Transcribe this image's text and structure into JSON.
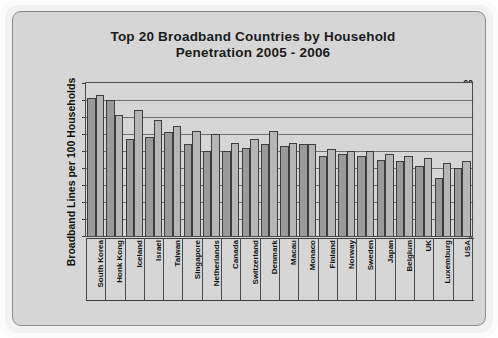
{
  "chart_data": {
    "type": "bar",
    "title": "Top 20 Broadband Countries by Household Penetration 2005 - 2006",
    "title_line1": "Top 20 Broadband Countries by Household",
    "title_line2": "Penetration 2005 - 2006",
    "xlabel": "",
    "ylabel": "Broadband Lines per 100 Households",
    "ylim": [
      0,
      90
    ],
    "ytick_labels": [
      "90",
      "80",
      "70",
      "60",
      "50",
      "40",
      "30",
      "20",
      "10",
      "0"
    ],
    "ytick_values": [
      90,
      80,
      70,
      60,
      50,
      40,
      30,
      20,
      10,
      0
    ],
    "grid": true,
    "legend_position": "top-right",
    "source_note": "Source: Point Topic",
    "categories": [
      "South Korea",
      "Honk Kong",
      "Iceland",
      "Israel",
      "Taiwan",
      "Singapore",
      "Netherlands",
      "Canada",
      "Switzerland",
      "Denmark",
      "Macau",
      "Monaco",
      "Finland",
      "Norway",
      "Sweden",
      "Japan",
      "Belgium",
      "UK",
      "Luxemburg",
      "USA"
    ],
    "series": [
      {
        "name": "Q1, 2005",
        "color": "#9a9a9a",
        "values": [
          81,
          80,
          57,
          58,
          61,
          54,
          50,
          50,
          52,
          54,
          53,
          54,
          47,
          48,
          47,
          45,
          44,
          41,
          34,
          40
        ]
      },
      {
        "name": "Q1, 2006",
        "color": "#b6b6b6",
        "values": [
          83,
          71,
          74,
          68,
          65,
          62,
          60,
          55,
          57,
          62,
          55,
          54,
          51,
          50,
          50,
          48,
          47,
          46,
          43,
          44
        ]
      }
    ]
  },
  "colors": {
    "series_2005": "#9a9a9a",
    "series_2006": "#b6b6b6",
    "panel_background": "#d6d6d6",
    "axis": "#3a3a3a",
    "text": "#141414"
  }
}
